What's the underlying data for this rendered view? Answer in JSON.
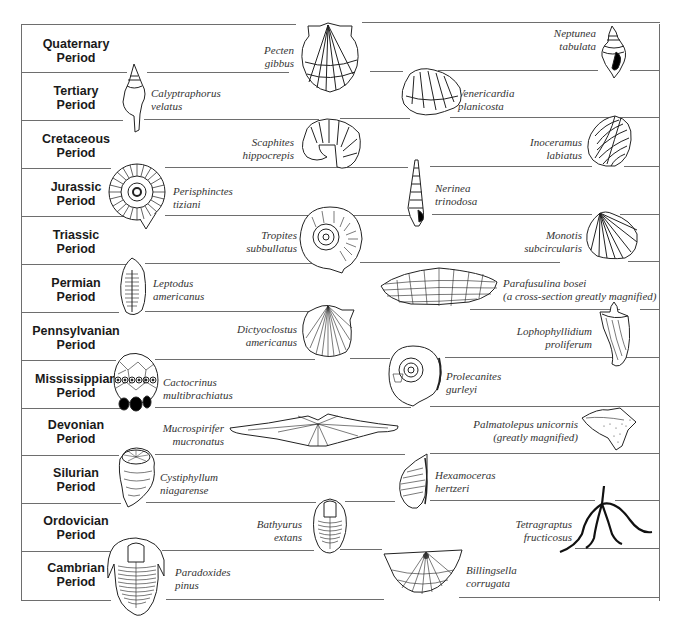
{
  "diagram": {
    "type": "geologic-time-fossil-chart",
    "frame": {
      "left": 21,
      "right": 660,
      "top": 24,
      "bottom": 600,
      "row_height": 48
    },
    "periods": [
      {
        "name": "Quaternary",
        "suffix": "Period"
      },
      {
        "name": "Tertiary",
        "suffix": "Period"
      },
      {
        "name": "Cretaceous",
        "suffix": "Period"
      },
      {
        "name": "Jurassic",
        "suffix": "Period"
      },
      {
        "name": "Triassic",
        "suffix": "Period"
      },
      {
        "name": "Permian",
        "suffix": "Period"
      },
      {
        "name": "Pennsylvanian",
        "suffix": "Period"
      },
      {
        "name": "Mississippian",
        "suffix": "Period"
      },
      {
        "name": "Devonian",
        "suffix": "Period"
      },
      {
        "name": "Silurian",
        "suffix": "Period"
      },
      {
        "name": "Ordovician",
        "suffix": "Period"
      },
      {
        "name": "Cambrian",
        "suffix": "Period"
      }
    ],
    "fossils": [
      {
        "period": "Quaternary",
        "genus": "Pecten",
        "species": "gibbus",
        "icon": "scallop-shell-icon"
      },
      {
        "period": "Quaternary",
        "genus": "Neptunea",
        "species": "tabulata",
        "icon": "whelk-shell-icon"
      },
      {
        "period": "Tertiary",
        "genus": "Calyptraphorus",
        "species": "velatus",
        "icon": "spindle-snail-icon"
      },
      {
        "period": "Tertiary",
        "genus": "Venericardia",
        "species": "planicosta",
        "icon": "clam-shell-icon"
      },
      {
        "period": "Cretaceous",
        "genus": "Scaphites",
        "species": "hippocrepis",
        "icon": "hooked-ammonite-icon"
      },
      {
        "period": "Cretaceous",
        "genus": "Inoceramus",
        "species": "labiatus",
        "icon": "ridged-clam-icon"
      },
      {
        "period": "Jurassic",
        "genus": "Perisphinctes",
        "species": "tiziani",
        "icon": "ammonite-icon"
      },
      {
        "period": "Jurassic",
        "genus": "Nerinea",
        "species": "trinodosa",
        "icon": "tower-snail-icon"
      },
      {
        "period": "Triassic",
        "genus": "Tropites",
        "species": "subbullatus",
        "icon": "ammonite-icon"
      },
      {
        "period": "Triassic",
        "genus": "Monotis",
        "species": "subcircularis",
        "icon": "fan-clam-icon"
      },
      {
        "period": "Permian",
        "genus": "Leptodus",
        "species": "americanus",
        "icon": "brachiopod-icon"
      },
      {
        "period": "Permian",
        "genus": "Parafusulina bosei",
        "species": "(a cross-section greatly magnified)",
        "icon": "fusulinid-icon"
      },
      {
        "period": "Pennsylvanian",
        "genus": "Dictyoclostus",
        "species": "americanus",
        "icon": "brachiopod-icon"
      },
      {
        "period": "Pennsylvanian",
        "genus": "Lophophyllidium",
        "species": "proliferum",
        "icon": "horn-coral-icon"
      },
      {
        "period": "Mississippian",
        "genus": "Cactocrinus",
        "species": "multibrachiatus",
        "icon": "crinoid-icon"
      },
      {
        "period": "Mississippian",
        "genus": "Prolecanites",
        "species": "gurleyi",
        "icon": "ammonoid-icon"
      },
      {
        "period": "Devonian",
        "genus": "Mucrospirifer",
        "species": "mucronatus",
        "icon": "winged-brachiopod-icon"
      },
      {
        "period": "Devonian",
        "genus": "Palmatolepus unicornis",
        "species": "(greatly magnified)",
        "icon": "conodont-icon"
      },
      {
        "period": "Silurian",
        "genus": "Cystiphyllum",
        "species": "niagarense",
        "icon": "coral-icon"
      },
      {
        "period": "Silurian",
        "genus": "Hexamoceras",
        "species": "hertzeri",
        "icon": "nautiloid-icon"
      },
      {
        "period": "Ordovician",
        "genus": "Bathyurus",
        "species": "extans",
        "icon": "trilobite-icon"
      },
      {
        "period": "Ordovician",
        "genus": "Tetragraptus",
        "species": "fructicosus",
        "icon": "graptolite-icon"
      },
      {
        "period": "Cambrian",
        "genus": "Paradoxides",
        "species": "pinus",
        "icon": "trilobite-icon"
      },
      {
        "period": "Cambrian",
        "genus": "Billingsella",
        "species": "corrugata",
        "icon": "brachiopod-icon"
      }
    ]
  }
}
